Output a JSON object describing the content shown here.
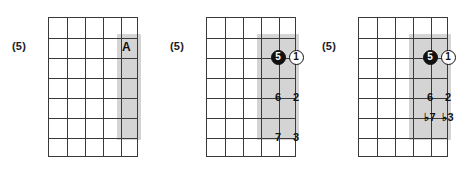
{
  "page": {
    "width": 458,
    "height": 178,
    "background": "#ffffff",
    "grid_line_color": "#3a3a3a",
    "shade_color": "#d4d4d4",
    "marker_fill_color": "#111111",
    "marker_open_color": "#ffffff"
  },
  "diagrams": [
    {
      "position_label": "(5)",
      "columns": 5,
      "rows": 7,
      "shaded": {
        "col_start": 5,
        "col_end": 5,
        "row_start": 2,
        "row_end": 6
      },
      "letter_label": "A",
      "markers": [],
      "degrees": []
    },
    {
      "position_label": "(5)",
      "columns": 5,
      "rows": 7,
      "shaded": {
        "col_start": 4,
        "col_end": 5,
        "row_start": 2,
        "row_end": 6
      },
      "letter_label": "",
      "markers": [
        {
          "label": "5",
          "style": "filled",
          "col": 4,
          "row": 2
        },
        {
          "label": "1",
          "style": "open",
          "col": 5,
          "row": 2
        }
      ],
      "degrees": [
        {
          "label": "6",
          "col": 4,
          "row": 4
        },
        {
          "label": "2",
          "col": 5,
          "row": 4
        },
        {
          "label": "7",
          "col": 4,
          "row": 6
        },
        {
          "label": "3",
          "col": 5,
          "row": 6
        }
      ]
    },
    {
      "position_label": "(5)",
      "columns": 5,
      "rows": 7,
      "shaded": {
        "col_start": 4,
        "col_end": 5,
        "row_start": 2,
        "row_end": 6
      },
      "letter_label": "",
      "markers": [
        {
          "label": "5",
          "style": "filled",
          "col": 4,
          "row": 2
        },
        {
          "label": "1",
          "style": "open",
          "col": 5,
          "row": 2
        }
      ],
      "degrees": [
        {
          "label": "6",
          "col": 4,
          "row": 4
        },
        {
          "label": "2",
          "col": 5,
          "row": 4
        },
        {
          "label": "♭7",
          "col": 4,
          "row": 5
        },
        {
          "label": "♭3",
          "col": 5,
          "row": 5
        }
      ]
    }
  ]
}
